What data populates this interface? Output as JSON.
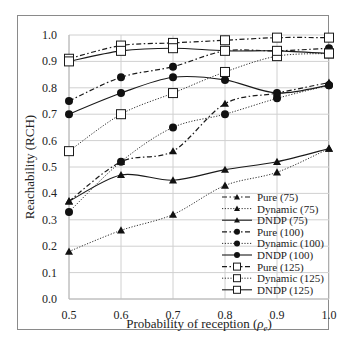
{
  "chart_data": {
    "type": "line",
    "title": "",
    "xlabel": "Probability of reception (ρe)",
    "ylabel": "Reachability (RCH)",
    "x": [
      0.5,
      0.6,
      0.7,
      0.8,
      0.9,
      1.0
    ],
    "x_tick_labels": [
      "0.5",
      "0.6",
      "0.7",
      "0.8",
      "0.9",
      "1.0"
    ],
    "y_tick_labels": [
      "0.0",
      "0.1",
      "0.2",
      "0.3",
      "0.4",
      "0.5",
      "0.6",
      "0.7",
      "0.8",
      "0.9",
      "1.0"
    ],
    "xlim": [
      0.5,
      1.0
    ],
    "ylim": [
      0.0,
      1.0
    ],
    "grid": true,
    "legend_position": "lower right, inside plot",
    "series": [
      {
        "name": "Pure (75)",
        "marker": "triangle",
        "line": "dashdot",
        "values": [
          0.37,
          0.52,
          0.56,
          0.74,
          0.78,
          0.82
        ]
      },
      {
        "name": "Dynamic (75)",
        "marker": "triangle",
        "line": "dotted",
        "values": [
          0.18,
          0.26,
          0.32,
          0.43,
          0.48,
          0.57
        ]
      },
      {
        "name": "DNDP (75)",
        "marker": "triangle",
        "line": "solid",
        "values": [
          0.37,
          0.47,
          0.45,
          0.49,
          0.52,
          0.57
        ]
      },
      {
        "name": "Pure (100)",
        "marker": "circle",
        "line": "dashdot",
        "values": [
          0.75,
          0.84,
          0.88,
          0.94,
          0.94,
          0.95
        ]
      },
      {
        "name": "Dynamic (100)",
        "marker": "circle",
        "line": "dotted",
        "values": [
          0.33,
          0.52,
          0.65,
          0.7,
          0.76,
          0.81
        ]
      },
      {
        "name": "DNDP (100)",
        "marker": "circle",
        "line": "solid",
        "values": [
          0.7,
          0.78,
          0.84,
          0.83,
          0.78,
          0.81
        ]
      },
      {
        "name": "Pure (125)",
        "marker": "square",
        "line": "dashdot",
        "values": [
          0.91,
          0.96,
          0.97,
          0.98,
          0.99,
          0.99
        ]
      },
      {
        "name": "Dynamic (125)",
        "marker": "square",
        "line": "dotted",
        "values": [
          0.56,
          0.7,
          0.78,
          0.86,
          0.92,
          0.93
        ]
      },
      {
        "name": "DNDP (125)",
        "marker": "square",
        "line": "solid",
        "values": [
          0.9,
          0.94,
          0.95,
          0.94,
          0.94,
          0.93
        ]
      }
    ]
  },
  "labels": {
    "xlabel_main": "Probability of reception (",
    "xlabel_sym": "ρ",
    "xlabel_sub": "e",
    "xlabel_close": ")",
    "ylabel": "Reachability (RCH)"
  },
  "colors": {
    "line": "#1a1a1a",
    "grid": "#d0d0d0",
    "frame": "#8a8a8a",
    "marker_fill": "#111111",
    "square_fill": "#ffffff"
  }
}
